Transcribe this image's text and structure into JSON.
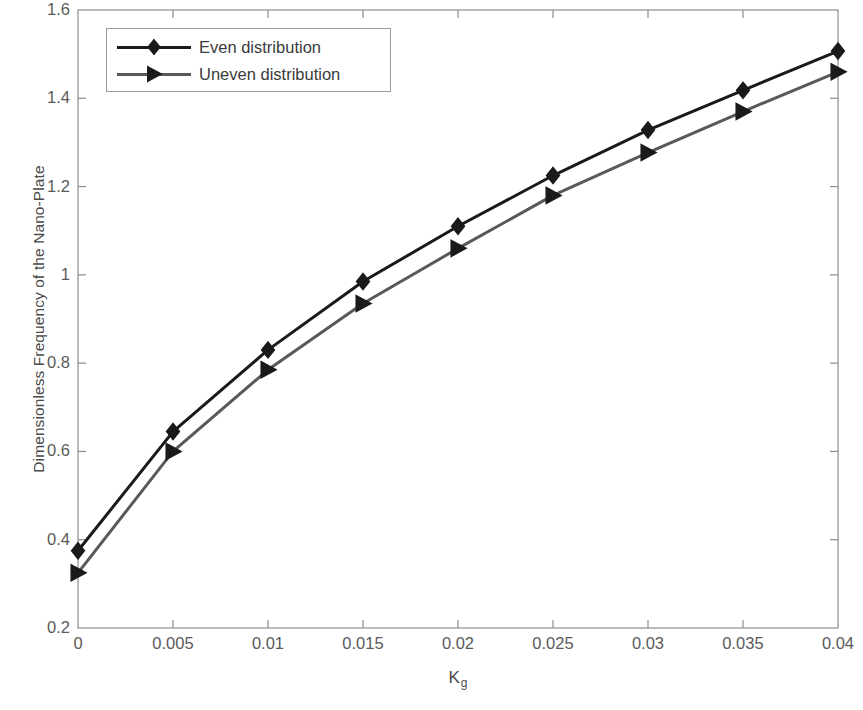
{
  "chart_data": {
    "type": "line",
    "title": "",
    "xlabel": "K_g",
    "xlabel_base": "K",
    "xlabel_sub": "g",
    "ylabel": "Dimensionless Frequency of the Nano-Plate",
    "xlim": [
      0,
      0.04
    ],
    "ylim": [
      0.2,
      1.6
    ],
    "xticks": [
      0,
      0.005,
      0.01,
      0.015,
      0.02,
      0.025,
      0.03,
      0.035,
      0.04
    ],
    "xtick_labels": [
      "0",
      "0.005",
      "0.01",
      "0.015",
      "0.02",
      "0.025",
      "0.03",
      "0.035",
      "0.04"
    ],
    "yticks": [
      0.2,
      0.4,
      0.6,
      0.8,
      1.0,
      1.2,
      1.4,
      1.6
    ],
    "ytick_labels": [
      "0.2",
      "0.4",
      "0.6",
      "0.8",
      "1",
      "1.2",
      "1.4",
      "1.6"
    ],
    "grid": false,
    "legend_position": "upper left",
    "x": [
      0,
      0.005,
      0.01,
      0.015,
      0.02,
      0.025,
      0.03,
      0.035,
      0.04
    ],
    "series": [
      {
        "name": "Even distribution",
        "values": [
          0.375,
          0.645,
          0.83,
          0.985,
          1.11,
          1.225,
          1.328,
          1.418,
          1.507
        ],
        "color": "#1a1a1a",
        "marker": "diamond",
        "linewidth": 3
      },
      {
        "name": "Uneven distribution",
        "values": [
          0.325,
          0.6,
          0.785,
          0.935,
          1.06,
          1.18,
          1.277,
          1.37,
          1.46
        ],
        "color": "#595959",
        "marker": "triangle-right",
        "linewidth": 3
      }
    ]
  },
  "legend": {
    "entries": [
      {
        "label": "Even distribution"
      },
      {
        "label": "Uneven distribution"
      }
    ]
  },
  "axes": {
    "box_color": "#8c8c8c",
    "tick_color": "#8c8c8c"
  }
}
